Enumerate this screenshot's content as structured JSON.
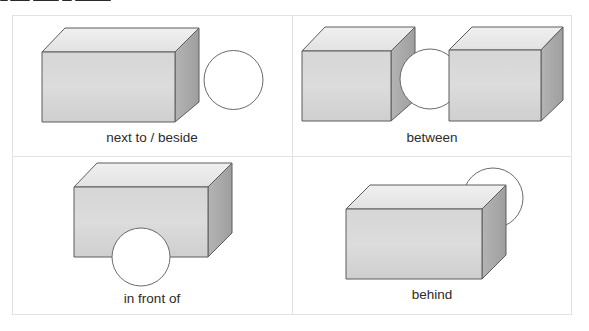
{
  "panels": [
    {
      "id": "next-to",
      "label": "next to / beside"
    },
    {
      "id": "between",
      "label": "between"
    },
    {
      "id": "in-front-of",
      "label": "in front of"
    },
    {
      "id": "behind",
      "label": "behind"
    }
  ],
  "colors": {
    "box_top": "#e9e9e9",
    "box_front": "#d2d2d2",
    "box_side": "#a9a9a9",
    "box_edge": "#5c5c5c",
    "circle_fill": "#ffffff",
    "circle_edge": "#6a6a6a",
    "grid_line": "#e2e2e2",
    "label_text": "#2b2b2b"
  }
}
